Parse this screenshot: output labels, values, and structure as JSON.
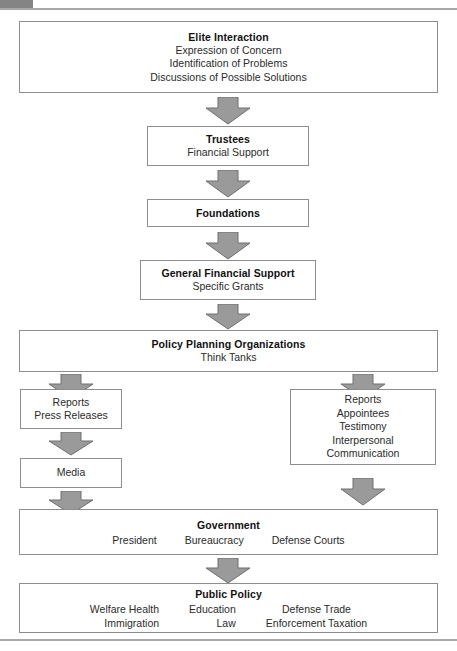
{
  "diagram": {
    "accent_color": "#848484",
    "arrow_fill": "#9a9a9a",
    "arrow_stroke": "#6f6f6f",
    "box_border": "#8d8d8d"
  },
  "nodes": {
    "elite": {
      "title": "Elite Interaction",
      "lines": [
        "Expression of Concern",
        "Identification of Problems",
        "Discussions of Possible Solutions"
      ]
    },
    "trustees": {
      "title": "Trustees",
      "lines": [
        "Financial Support"
      ]
    },
    "foundations": {
      "title": "Foundations",
      "lines": []
    },
    "general_support": {
      "title": "General Financial Support",
      "lines": [
        "Specific Grants"
      ]
    },
    "policy_planning": {
      "title": "Policy Planning Organizations",
      "lines": [
        "Think Tanks"
      ]
    },
    "reports_left": {
      "title": "",
      "lines": [
        "Reports",
        "Press Releases"
      ]
    },
    "media": {
      "title": "",
      "lines": [
        "Media"
      ]
    },
    "reports_right": {
      "title": "",
      "lines": [
        "Reports",
        "Appointees",
        "Testimony",
        "Interpersonal",
        "Communication"
      ]
    },
    "government": {
      "title": "Government",
      "columns": [
        "President",
        "Bureaucracy",
        "Defense Courts"
      ]
    },
    "public_policy": {
      "title": "Public Policy",
      "columns": [
        [
          "Welfare Health",
          "Immigration"
        ],
        [
          "Education",
          "Law"
        ],
        [
          "Defense Trade",
          "Enforcement Taxation"
        ]
      ]
    }
  },
  "arrows": {
    "elite_to_trustees": "down-block-arrow",
    "trustees_to_foundations": "down-block-arrow",
    "foundations_to_general": "down-block-arrow",
    "general_to_policy": "down-block-arrow",
    "policy_to_reports_left": "down-block-arrow",
    "policy_to_reports_right": "down-block-arrow",
    "reports_left_to_media": "down-block-arrow",
    "media_to_government": "down-block-arrow",
    "reports_right_to_government": "down-block-arrow",
    "government_to_public_policy": "down-block-arrow"
  }
}
